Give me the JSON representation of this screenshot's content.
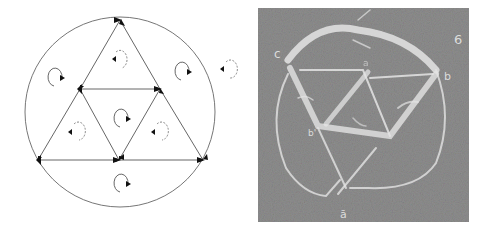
{
  "figure": {
    "left_panel": {
      "type": "schematic",
      "description": "Circle circumscribing a large triangle subdivided into four triangles; arrows on edges and rotation markers in each region",
      "colors": {
        "line": "#555555",
        "arrow": "#111111",
        "dashed_marker": "#777777",
        "background": "#ffffff"
      },
      "circle": {
        "cx": 120,
        "cy": 112,
        "r": 95
      },
      "vertices": {
        "top": [
          120,
          20
        ],
        "mid_left": [
          80,
          89
        ],
        "mid_right": [
          160,
          89
        ],
        "bottom_left": [
          38,
          160
        ],
        "bottom_mid": [
          119,
          160
        ],
        "bottom_right": [
          203,
          160
        ]
      },
      "rotation_markers": [
        {
          "region": "top-triangle",
          "x": 119,
          "y": 60,
          "style": "dashed"
        },
        {
          "region": "upper-left-outside",
          "x": 55,
          "y": 78,
          "style": "solid"
        },
        {
          "region": "upper-right-outside",
          "x": 182,
          "y": 72,
          "style": "solid"
        },
        {
          "region": "outside-circle-right",
          "x": 228,
          "y": 70,
          "style": "dashed"
        },
        {
          "region": "center-triangle",
          "x": 122,
          "y": 118,
          "style": "solid"
        },
        {
          "region": "left-triangle",
          "x": 76,
          "y": 132,
          "style": "dashed"
        },
        {
          "region": "right-triangle",
          "x": 158,
          "y": 132,
          "style": "dashed"
        },
        {
          "region": "bottom-segment",
          "x": 122,
          "y": 182,
          "style": "solid"
        }
      ]
    },
    "right_panel": {
      "type": "photograph",
      "description": "Chalkboard drawing of a circle with an inscribed triangular network drawn in chalk",
      "colors": {
        "board": "#8e8e8e",
        "chalk": "#e4e4e4"
      },
      "chalk_labels": [
        "c",
        "a",
        "b",
        "6",
        "b'",
        "ā"
      ]
    }
  }
}
